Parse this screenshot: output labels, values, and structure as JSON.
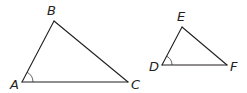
{
  "figure": {
    "stroke_color": "#231f20",
    "background_color": "#ffffff",
    "triangles": [
      {
        "name": "ABC",
        "vertices": [
          "A",
          "B",
          "C"
        ],
        "marked_angle": "A"
      },
      {
        "name": "DEF",
        "vertices": [
          "D",
          "E",
          "F"
        ],
        "marked_angle": "D"
      }
    ],
    "labels": {
      "A": "A",
      "B": "B",
      "C": "C",
      "D": "D",
      "E": "E",
      "F": "F"
    }
  }
}
